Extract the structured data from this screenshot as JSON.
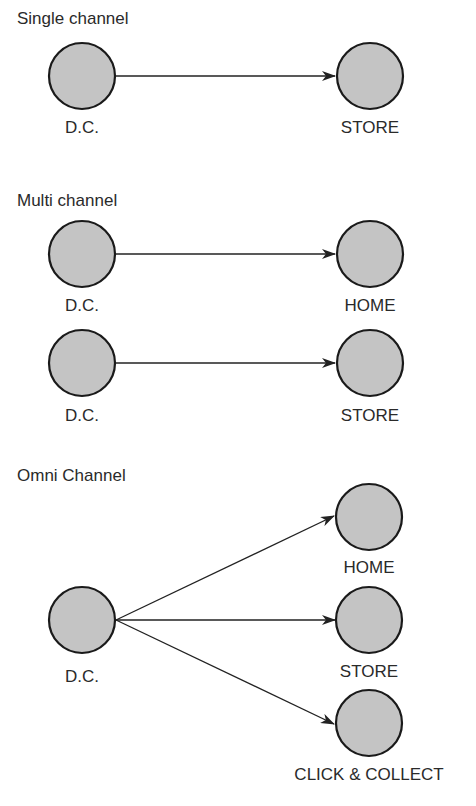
{
  "sections": [
    {
      "title": "Single channel",
      "nodes": [
        {
          "label": "D.C."
        },
        {
          "label": "STORE"
        }
      ]
    },
    {
      "title": "Multi channel",
      "nodes": [
        {
          "label": "D.C."
        },
        {
          "label": "HOME"
        },
        {
          "label": "D.C."
        },
        {
          "label": "STORE"
        }
      ]
    },
    {
      "title": "Omni Channel",
      "nodes": [
        {
          "label": "D.C."
        },
        {
          "label": "HOME"
        },
        {
          "label": "STORE"
        },
        {
          "label": "CLICK & COLLECT"
        }
      ]
    }
  ],
  "colors": {
    "node_fill": "#c4c4c4",
    "node_stroke": "#1a1a1a",
    "arrow": "#222222"
  }
}
